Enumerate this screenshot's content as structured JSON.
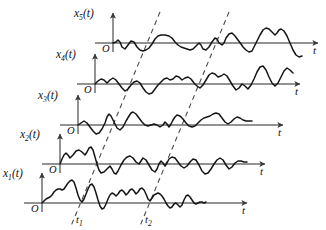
{
  "figure": {
    "background_color": "#ffffff",
    "signal_color": "#151515",
    "axis_color": "#6f6f6f",
    "dashed_color": "#4a4a4a",
    "width": 326,
    "height": 230
  },
  "traces": [
    {
      "id": "x5",
      "label_base": "x",
      "label_sub": "5",
      "label_tail": "(t)",
      "origin_label": "O",
      "axis_label": "t",
      "origin_x": 113,
      "baseline_y": 43,
      "axis_top_y": 13,
      "axis_end_x": 318,
      "label_x": 74,
      "label_y": 17,
      "points": "113,43 116,42 118,40 120,42 122,47 125,49 128,45 131,41 134,42 137,47 140,50 143,51 146,50 149,48 152,44 155,39 158,36 161,35 165,35 169,36 172,38 175,42 178,45 181,47 184,48 187,49 190,50 193,49 196,46 199,43 201,45 203,49 206,50 209,47 212,42 215,38 217,39 219,43 222,45 224,43 226,38 229,34 232,33 235,36 238,40 241,44 243,47 246,50 249,52 252,51 254,47 257,41 260,35 263,30 266,28 269,29 272,32 275,35 277,33 279,30 281,29 284,31 287,36 290,43 293,50 296,55 299,57 302,56"
    },
    {
      "id": "x4",
      "label_base": "x",
      "label_sub": "4",
      "label_tail": "(t)",
      "origin_label": "O",
      "axis_label": "t",
      "origin_x": 95,
      "baseline_y": 84,
      "axis_top_y": 54,
      "axis_end_x": 300,
      "label_x": 56,
      "label_y": 58,
      "points": "95,84 98,81 101,79 104,80 107,83 110,80 113,78 116,80 119,84 122,88 125,91 128,89 131,85 134,82 137,81 140,83 143,88 146,92 149,94 152,93 155,89 158,85 161,82 164,79 167,78 170,80 173,79 176,76 179,77 182,80 185,78 188,77 191,79 194,83 197,86 200,88 203,85 206,80 209,75 212,73 215,74 218,77 221,76 224,74 227,76 230,81 233,86 236,90 239,88 242,84 245,86 248,89 251,85 254,79 257,72 260,67 263,66 266,70 269,77 272,83 275,86 278,83 281,77 284,71 287,68 290,70 293,73"
    },
    {
      "id": "x3",
      "label_base": "x",
      "label_sub": "3",
      "label_tail": "(t)",
      "origin_label": "O",
      "axis_label": "t",
      "origin_x": 78,
      "baseline_y": 125,
      "axis_top_y": 95,
      "axis_end_x": 283,
      "label_x": 38,
      "label_y": 99,
      "points": "78,125 81,123 84,121 87,123 90,127 93,131 96,134 99,133 102,129 105,123 107,117 109,114 111,116 114,122 117,128 120,130 123,127 126,121 129,116 131,113 133,112 136,114 139,118 142,122 145,125 148,126 151,125 154,124 157,125 160,127 163,125 165,122 167,124 169,127 171,124 173,120 175,117 177,115 180,116 183,119 186,123 189,126 192,127 195,126 198,123 201,120 204,118 207,117 210,116 213,114 216,113 219,114 222,118 225,122 228,124 231,122 234,119 237,117 240,118 243,120 246,121 249,121 252,121"
    },
    {
      "id": "x2",
      "label_base": "x",
      "label_sub": "2",
      "label_tail": "(t)",
      "origin_label": "O",
      "axis_label": "t",
      "origin_x": 60,
      "baseline_y": 164,
      "axis_top_y": 134,
      "axis_end_x": 265,
      "label_x": 20,
      "label_y": 138,
      "points": "60,164 62,159 64,155 66,153 68,155 70,158 73,155 76,151 79,150 82,152 85,155 87,152 89,148 91,147 93,150 95,157 97,164 99,170 101,173 104,172 107,169 110,166 112,169 114,173 116,174 118,171 121,165 124,160 127,157 130,156 133,158 136,162 139,164 141,161 143,158 146,160 149,165 152,170 155,172 157,169 159,164 161,161 163,163 165,166 167,163 169,159 172,157 175,158 178,162 181,166 184,168 187,166 190,162 193,159 196,160 199,165 202,171 205,174 208,173 211,169 214,164 217,160 220,158 223,160 226,165 229,169 232,167 235,163 238,161 241,161 244,162 247,162"
    },
    {
      "id": "x1",
      "label_base": "x",
      "label_sub": "1",
      "label_tail": "(t)",
      "origin_label": "O",
      "axis_label": "t",
      "origin_x": 42,
      "baseline_y": 203,
      "axis_top_y": 173,
      "axis_end_x": 247,
      "label_x": 3,
      "label_y": 177,
      "points": "42,203 44,201 46,199 48,198 50,197 52,195 54,192 56,190 58,189 60,189 62,190 64,189 66,186 68,183 70,181 72,180 74,182 76,188 78,195 80,200 82,202 84,199 86,194 88,189 90,185 92,184 94,187 96,193 98,200 100,206 102,209 104,208 106,204 108,199 110,195 112,193 114,194 116,196 118,194 120,191 122,190 124,192 126,195 128,193 130,190 132,189 134,191 136,194 138,192 140,189 142,188 144,190 146,194 148,199 150,201 152,198 154,195 156,194 158,193 160,194 162,196 164,199 166,203 168,206 170,208 172,207 174,204 176,203 178,205 180,207 182,205 184,200 186,196 188,195 190,197 192,200 194,203 196,204 198,203 200,202 202,202 204,203 206,202"
    }
  ],
  "dashed_lines": [
    {
      "id": "t1",
      "label": "t",
      "label_sub": "1",
      "x1": 160,
      "y1": 12,
      "x2": 71,
      "y2": 226,
      "label_x": 76,
      "label_y": 223
    },
    {
      "id": "t2",
      "label": "t",
      "label_sub": "2",
      "x1": 229,
      "y1": 12,
      "x2": 140,
      "y2": 226,
      "label_x": 145,
      "label_y": 223
    }
  ],
  "icons": {
    "axis_arrow": "arrow-head-icon"
  }
}
